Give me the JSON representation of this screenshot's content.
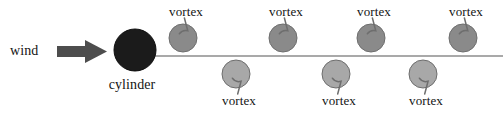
{
  "figure": {
    "type": "vortex-shedding-diagram",
    "width": 503,
    "height": 115,
    "background": "#ffffff"
  },
  "labels": {
    "wind": "wind",
    "cylinder": "cylinder",
    "vortex": "vortex"
  },
  "colors": {
    "cylinder_fill": "#1b1b1b",
    "vortex_top_fill": "#8a8a8a",
    "vortex_bottom_fill": "#a8a8a8",
    "vortex_stroke": "#6e6e6e",
    "arrow_fill": "#4d4d4d",
    "wake_line": "#8c8c8c",
    "text": "#141414"
  },
  "wind_arrow": {
    "label": "wind",
    "label_x": 10,
    "label_y": 57,
    "shaft_x": 57,
    "shaft_y": 46,
    "shaft_w": 30,
    "shaft_h": 11,
    "head_x": 85,
    "head_y": 40,
    "head_w": 22,
    "head_h": 23
  },
  "cylinder": {
    "label": "cylinder",
    "cx": 135,
    "cy": 50,
    "r": 21,
    "label_x": 132,
    "label_y": 91
  },
  "wake_line": {
    "x1": 152,
    "y1": 56,
    "x2": 503,
    "y2": 56,
    "width": 1.4
  },
  "vortices": {
    "top": [
      {
        "label": "vortex",
        "cx": 183,
        "cy": 38,
        "r": 14,
        "label_x": 186,
        "label_y": 17
      },
      {
        "label": "vortex",
        "cx": 283,
        "cy": 38,
        "r": 14,
        "label_x": 286,
        "label_y": 17
      },
      {
        "label": "vortex",
        "cx": 371,
        "cy": 38,
        "r": 14,
        "label_x": 374,
        "label_y": 17
      },
      {
        "label": "vortex",
        "cx": 463,
        "cy": 38,
        "r": 14,
        "label_x": 466,
        "label_y": 17
      }
    ],
    "bottom": [
      {
        "label": "vortex",
        "cx": 236,
        "cy": 74,
        "r": 14,
        "label_x": 239,
        "label_y": 106
      },
      {
        "label": "vortex",
        "cx": 336,
        "cy": 74,
        "r": 14,
        "label_x": 339,
        "label_y": 106
      },
      {
        "label": "vortex",
        "cx": 423,
        "cy": 74,
        "r": 14,
        "label_x": 426,
        "label_y": 106
      }
    ]
  }
}
